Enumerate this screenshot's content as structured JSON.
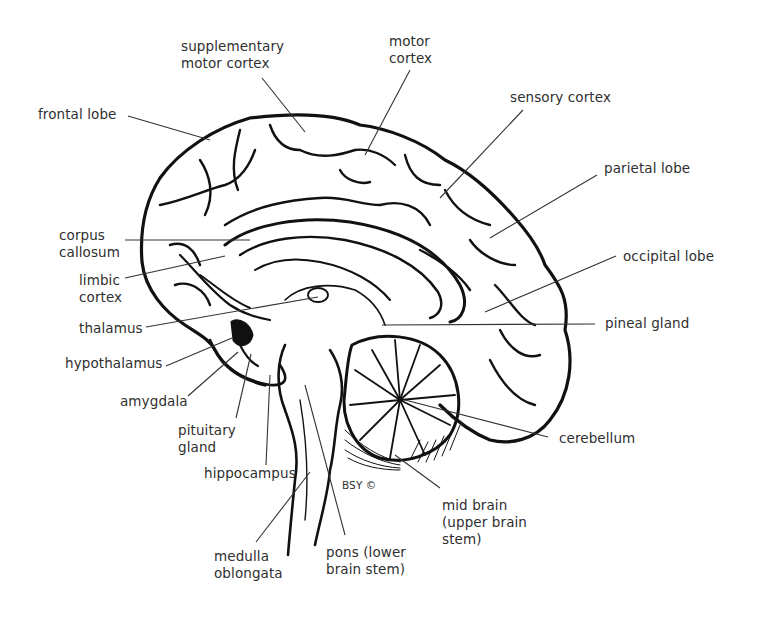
{
  "diagram": {
    "credit": "BSY ©",
    "labels": {
      "supplementary_motor_cortex": "supplementary\nmotor cortex",
      "motor_cortex": "motor\ncortex",
      "sensory_cortex": "sensory cortex",
      "frontal_lobe": "frontal lobe",
      "parietal_lobe": "parietal lobe",
      "corpus_callosum": "corpus\ncallosum",
      "occipital_lobe": "occipital lobe",
      "limbic_cortex": "limbic\ncortex",
      "thalamus": "thalamus",
      "pineal_gland": "pineal gland",
      "hypothalamus": "hypothalamus",
      "amygdala": "amygdala",
      "cerebellum": "cerebellum",
      "pituitary_gland": "pituitary\ngland",
      "hippocampus": "hippocampus",
      "mid_brain": "mid brain\n(upper brain\nstem)",
      "medulla_oblongata": "medulla\noblongata",
      "pons": "pons (lower\nbrain stem)"
    },
    "colors": {
      "ink": "#111111",
      "label_text": "#2f2f2f",
      "leader_line": "#333333",
      "background": "#ffffff"
    }
  }
}
